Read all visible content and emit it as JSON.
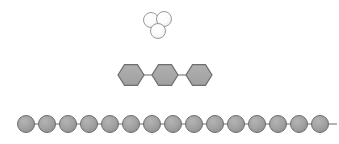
{
  "figure": {
    "title": "Molecular structure schematics",
    "background_color": "#ffffff",
    "width": 339,
    "height": 144
  },
  "chart_data": {
    "type": "diagram",
    "title": "Molecular structure schematics",
    "subtitle": "",
    "xlabel": "",
    "ylabel": "",
    "grid": false,
    "legend": "none",
    "groups": [
      {
        "name": "sphere-trimer-cluster",
        "label": "Trimer cluster",
        "shape": "circle",
        "count": 3,
        "fill": "#fbfbfb",
        "stroke": "#9a9a9a",
        "stroke_width": 1,
        "radius": 7.5,
        "nodes": [
          {
            "id": "t1",
            "cx": 151,
            "cy": 20
          },
          {
            "id": "t2",
            "cx": 164,
            "cy": 19
          },
          {
            "id": "t3",
            "cx": 158,
            "cy": 31
          }
        ],
        "bonds": []
      },
      {
        "name": "hexagon-trimer-chain",
        "label": "Linked hexagonal rings",
        "shape": "hexagon",
        "count": 3,
        "fill": "#a8a8a8",
        "stroke": "#6e6e6e",
        "stroke_width": 1.2,
        "radius": 13,
        "orientation": "pointy-left-right",
        "nodes": [
          {
            "id": "h1",
            "cx": 131,
            "cy": 75
          },
          {
            "id": "h2",
            "cx": 165,
            "cy": 75
          },
          {
            "id": "h3",
            "cx": 199,
            "cy": 75
          }
        ],
        "bonds": [
          {
            "from": "h1",
            "to": "h2"
          },
          {
            "from": "h2",
            "to": "h3"
          }
        ]
      },
      {
        "name": "sphere-polymer-chain",
        "label": "Linear polymer chain",
        "shape": "circle",
        "count": 15,
        "fill": "#9e9e9e",
        "stroke": "#6e6e6e",
        "stroke_width": 1,
        "radius": 8.5,
        "baseline_y": 124,
        "spacing": 21,
        "tail_stub": true,
        "nodes": [
          {
            "id": "c1",
            "cx": 26,
            "cy": 124
          },
          {
            "id": "c2",
            "cx": 47,
            "cy": 124
          },
          {
            "id": "c3",
            "cx": 68,
            "cy": 124
          },
          {
            "id": "c4",
            "cx": 89,
            "cy": 124
          },
          {
            "id": "c5",
            "cx": 110,
            "cy": 124
          },
          {
            "id": "c6",
            "cx": 131,
            "cy": 124
          },
          {
            "id": "c7",
            "cx": 152,
            "cy": 124
          },
          {
            "id": "c8",
            "cx": 173,
            "cy": 124
          },
          {
            "id": "c9",
            "cx": 194,
            "cy": 124
          },
          {
            "id": "c10",
            "cx": 215,
            "cy": 124
          },
          {
            "id": "c11",
            "cx": 236,
            "cy": 124
          },
          {
            "id": "c12",
            "cx": 257,
            "cy": 124
          },
          {
            "id": "c13",
            "cx": 278,
            "cy": 124
          },
          {
            "id": "c14",
            "cx": 299,
            "cy": 124
          },
          {
            "id": "c15",
            "cx": 320,
            "cy": 124
          }
        ],
        "bonds": [
          {
            "from": "c1",
            "to": "c2"
          },
          {
            "from": "c2",
            "to": "c3"
          },
          {
            "from": "c3",
            "to": "c4"
          },
          {
            "from": "c4",
            "to": "c5"
          },
          {
            "from": "c5",
            "to": "c6"
          },
          {
            "from": "c6",
            "to": "c7"
          },
          {
            "from": "c7",
            "to": "c8"
          },
          {
            "from": "c8",
            "to": "c9"
          },
          {
            "from": "c9",
            "to": "c10"
          },
          {
            "from": "c10",
            "to": "c11"
          },
          {
            "from": "c11",
            "to": "c12"
          },
          {
            "from": "c12",
            "to": "c13"
          },
          {
            "from": "c13",
            "to": "c14"
          },
          {
            "from": "c14",
            "to": "c15"
          }
        ],
        "tail": {
          "x1": 328,
          "y1": 124,
          "x2": 337,
          "y2": 124
        }
      }
    ],
    "colors": {
      "sphere_light_fill": "#fbfbfb",
      "sphere_light_stroke": "#9a9a9a",
      "hexagon_fill": "#a8a8a8",
      "hexagon_stroke": "#6e6e6e",
      "sphere_gray_fill": "#9e9e9e",
      "sphere_gray_stroke": "#6e6e6e",
      "bond_stroke": "#777777",
      "background": "#ffffff"
    }
  }
}
